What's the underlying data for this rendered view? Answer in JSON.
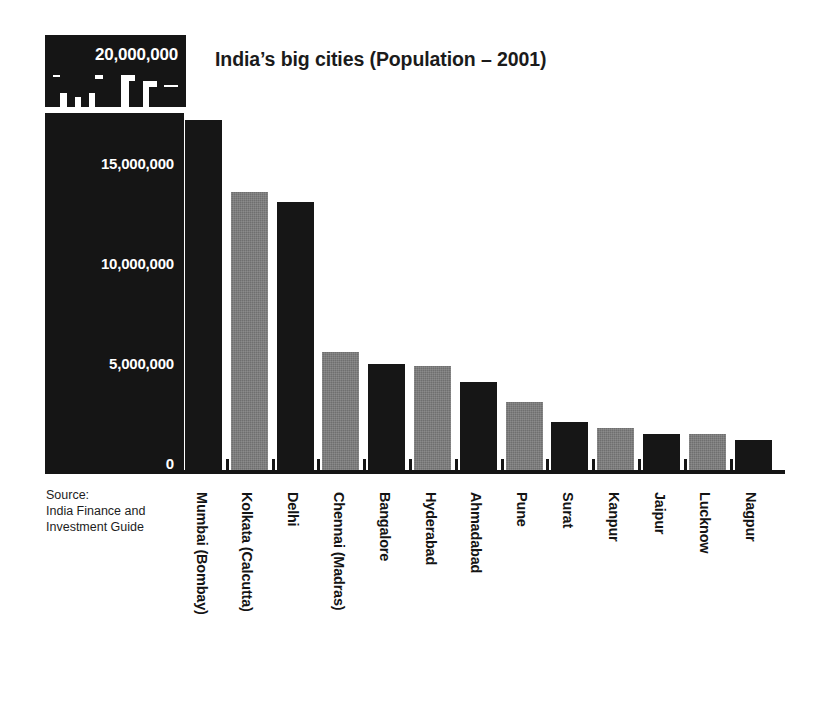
{
  "badge": {
    "icon": "city-skyline-icon",
    "value_label": "20,000,000"
  },
  "title": "India’s big cities (Population – 2001)",
  "source": {
    "line1": "Source:",
    "line2": "India Finance and",
    "line3": "Investment Guide"
  },
  "colors": {
    "dark_bar": "#161616",
    "light_bar": "#6f6f6f",
    "axis_panel": "#151515",
    "background": "#ffffff",
    "text": "#141414",
    "axis_text": "#ffffff"
  },
  "chart_data": {
    "type": "bar",
    "title": "India’s big cities (Population – 2001)",
    "xlabel": "",
    "ylabel": "",
    "ylim": [
      0,
      20000000
    ],
    "grid": false,
    "legend": "none",
    "y_tick_labels": [
      "20,000,000",
      "15,000,000",
      "10,000,000",
      "5,000,000",
      "0"
    ],
    "y_ticks": [
      20000000,
      15000000,
      10000000,
      5000000,
      0
    ],
    "categories": [
      "Mumbai (Bombay)",
      "Kolkata (Calcutta)",
      "Delhi",
      "Chennai (Madras)",
      "Bangalore",
      "Hyderabad",
      "Ahmadabad",
      "Pune",
      "Surat",
      "Kanpur",
      "Jaipur",
      "Lucknow",
      "Nagpur"
    ],
    "values": [
      17500000,
      13900000,
      13400000,
      5900000,
      5300000,
      5200000,
      4400000,
      3400000,
      2400000,
      2100000,
      1800000,
      1800000,
      1500000
    ],
    "bar_colors": [
      "dark",
      "light",
      "dark",
      "light",
      "dark",
      "light",
      "dark",
      "light",
      "dark",
      "light",
      "dark",
      "light",
      "dark"
    ]
  }
}
